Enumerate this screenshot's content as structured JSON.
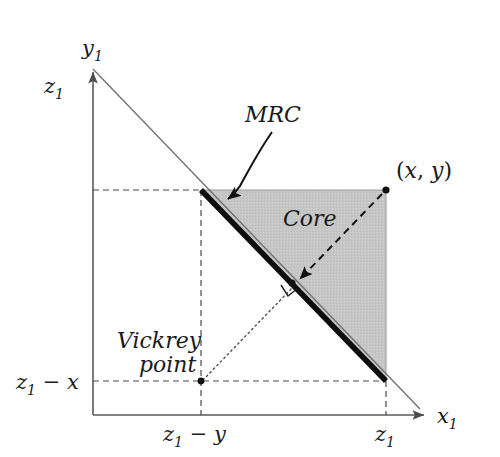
{
  "figure": {
    "background_color": "#ffffff",
    "axes": {
      "x_axis_label": "x",
      "x_axis_sub": "1",
      "y_axis_label": "y",
      "y_axis_sub": "1",
      "axis_color": "#4d4d4d"
    },
    "ticks": {
      "y_top": {
        "main": "z",
        "sub": "1"
      },
      "y_low": {
        "main": "z",
        "sub": "1",
        "op": " − ",
        "tail": "x"
      },
      "x_right": {
        "main": "z",
        "sub": "1"
      },
      "x_mid": {
        "main": "z",
        "sub": "1",
        "op": " − ",
        "tail": "y"
      }
    },
    "labels": {
      "mrc": "MRC",
      "core": "Core",
      "vickrey_line1": "Vickrey",
      "vickrey_line2": "point",
      "point_xy_open": "(",
      "point_xy_x": "x",
      "point_xy_comma": ", ",
      "point_xy_y": "y",
      "point_xy_close": ")"
    },
    "colors": {
      "core_fill": "#c4c4c4",
      "core_edge": "#8a8a8a",
      "mrc_line": "#0d0d0d",
      "budget_line": "#6b6b6b",
      "dashed_guide": "#4a4a4a",
      "dotted_guide": "#555555",
      "text": "#1a1a1a"
    },
    "geometry": {
      "origin": {
        "x": 93,
        "y": 415
      },
      "y_axis_top": {
        "x": 93,
        "y": 68
      },
      "x_axis_right": {
        "x": 428,
        "y": 415
      },
      "core_top_left": {
        "x": 201,
        "y": 190
      },
      "core_top_right": {
        "x": 386,
        "y": 190
      },
      "core_bottom_right": {
        "x": 386,
        "y": 381
      },
      "vickrey_point": {
        "x": 201,
        "y": 381
      },
      "perp_foot": {
        "x": 293,
        "y": 286
      },
      "z1_on_x_axis": {
        "x": 386,
        "y": 415
      },
      "budget_line_end": {
        "x": 420,
        "y": 409
      }
    }
  }
}
